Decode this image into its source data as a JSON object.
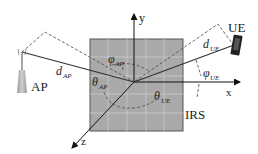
{
  "diagram": {
    "labels": {
      "ap": "AP",
      "ue": "UE",
      "irs": "IRS",
      "x_axis": "x",
      "y_axis": "y",
      "z_axis": "z",
      "d_ap": "d",
      "d_ap_sub": "AP",
      "d_ue": "d",
      "d_ue_sub": "UE",
      "phi_ap": "φ",
      "phi_ap_sub": "AP",
      "theta_ap": "θ",
      "theta_ap_sub": "AP",
      "phi_ue": "φ",
      "phi_ue_sub": "UE",
      "theta_ue": "θ",
      "theta_ue_sub": "UE"
    },
    "colors": {
      "irs_fill": "#a9a9a9",
      "irs_grid": "#c8c8c8",
      "irs_border": "#555555",
      "line": "#333333",
      "dashed": "#555555",
      "ap_body": "#b0b0b0",
      "ue_body": "#222222"
    }
  }
}
